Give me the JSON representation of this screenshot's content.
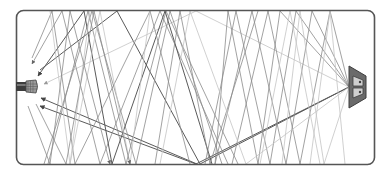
{
  "diagram": {
    "colors": {
      "room_outline": "#555555",
      "reflection_dark": "#5a5a5a",
      "reflection_mid": "#8a8a8a",
      "reflection_light": "#c4c4c4",
      "speaker_body": "#6e6e6e",
      "speaker_driver": "#cfcfcf",
      "mic_handle": "#444444",
      "mic_grille": "#b8b8b8"
    },
    "elements": {
      "source": "loudspeaker",
      "receiver": "microphone",
      "enclosure": "room"
    }
  }
}
